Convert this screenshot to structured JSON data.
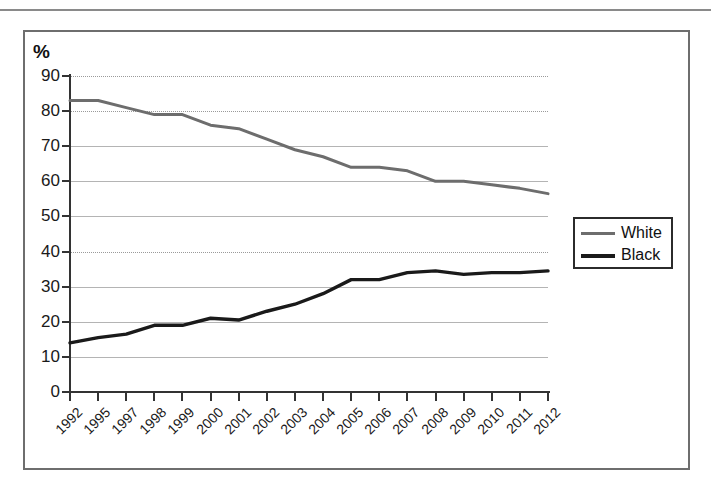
{
  "axis": {
    "y_unit_label": "%",
    "y_ticks": [
      0,
      10,
      20,
      30,
      40,
      50,
      60,
      70,
      80,
      90
    ],
    "y_min": 0,
    "y_max": 90
  },
  "legend": {
    "position": "right",
    "items": [
      {
        "label": "White",
        "color": "#6d6d6d"
      },
      {
        "label": "Black",
        "color": "#1a1a1a"
      }
    ]
  },
  "chart_data": {
    "type": "line",
    "title": "",
    "subtitle": "",
    "xlabel": "",
    "ylabel": "%",
    "ylim": [
      0,
      90
    ],
    "ytick_step": 10,
    "grid": true,
    "legend_position": "right",
    "categories": [
      "1992",
      "1995",
      "1997",
      "1998",
      "1999",
      "2000",
      "2001",
      "2002",
      "2003",
      "2004",
      "2005",
      "2006",
      "2007",
      "2008",
      "2009",
      "2010",
      "2011",
      "2012"
    ],
    "series": [
      {
        "name": "White",
        "color": "#6d6d6d",
        "values": [
          83,
          83,
          81,
          79,
          79,
          76,
          75,
          72,
          69,
          67,
          64,
          64,
          63,
          60,
          60,
          59,
          58,
          56.5
        ]
      },
      {
        "name": "Black",
        "color": "#1a1a1a",
        "values": [
          14,
          15.5,
          16.5,
          19,
          19,
          21,
          20.5,
          23,
          25,
          28,
          32,
          32,
          34,
          34.5,
          33.5,
          34,
          34,
          34.5
        ]
      }
    ]
  }
}
